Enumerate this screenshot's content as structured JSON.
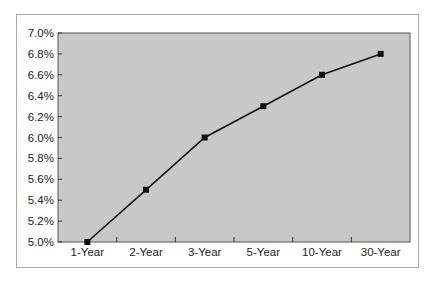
{
  "chart_data": {
    "type": "line",
    "title": "",
    "xlabel": "",
    "ylabel": "",
    "categories": [
      "1-Year",
      "2-Year",
      "3-Year",
      "5-Year",
      "10-Year",
      "30-Year"
    ],
    "series": [
      {
        "name": "Yield",
        "values": [
          5.0,
          5.5,
          6.0,
          6.3,
          6.6,
          6.8
        ]
      }
    ],
    "ylim": [
      5.0,
      7.0
    ],
    "yticks": [
      "5.0%",
      "5.2%",
      "5.4%",
      "5.6%",
      "5.8%",
      "6.0%",
      "6.2%",
      "6.4%",
      "6.6%",
      "6.8%",
      "7.0%"
    ],
    "grid": false,
    "legend": "none",
    "colors": {
      "plot_bg": "#c8c8c8",
      "line": "#111111",
      "marker": "#111111",
      "frame": "#a8a8a8"
    }
  }
}
